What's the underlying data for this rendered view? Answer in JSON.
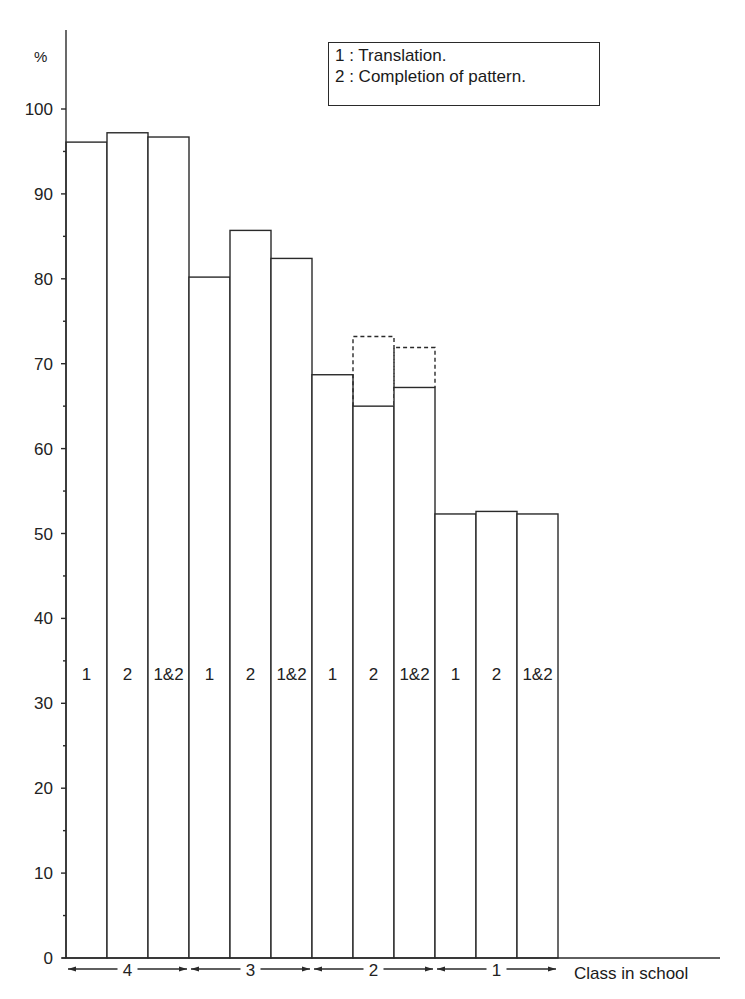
{
  "chart_data": {
    "type": "bar",
    "title": "",
    "xlabel": "Class in school",
    "ylabel": "%",
    "ylim": [
      0,
      100
    ],
    "yticks": [
      0,
      10,
      20,
      30,
      40,
      50,
      60,
      70,
      80,
      90,
      100
    ],
    "grid": false,
    "legend": {
      "position": "top-right",
      "entries": [
        "1 : Translation.",
        "2 : Completion of pattern."
      ]
    },
    "groups": [
      "4",
      "3",
      "2",
      "1"
    ],
    "bar_labels": [
      "1",
      "2",
      "1&2"
    ],
    "series": [
      {
        "name": "1 (Translation)",
        "values": [
          96.1,
          80.2,
          68.7,
          52.3
        ]
      },
      {
        "name": "2 (Completion of pattern)",
        "values": [
          97.2,
          85.7,
          65.0,
          52.6
        ]
      },
      {
        "name": "1&2",
        "values": [
          96.7,
          82.4,
          67.2,
          52.3
        ]
      }
    ],
    "dashed_overlay": {
      "description": "dotted outline above class 2 bars",
      "class": "2",
      "values": {
        "2": 73.2,
        "1&2": 71.9
      }
    }
  },
  "legend": {
    "line1": "1 : Translation.",
    "line2": "2 : Completion of pattern."
  },
  "axis": {
    "ylabel": "%",
    "xlabel": "Class in school",
    "ticks": [
      "0",
      "10",
      "20",
      "30",
      "40",
      "50",
      "60",
      "70",
      "80",
      "90",
      "100"
    ]
  },
  "groups": [
    {
      "label": "4",
      "bars": [
        {
          "label": "1",
          "value": 96.1
        },
        {
          "label": "2",
          "value": 97.2
        },
        {
          "label": "1&2",
          "value": 96.7
        }
      ]
    },
    {
      "label": "3",
      "bars": [
        {
          "label": "1",
          "value": 80.2
        },
        {
          "label": "2",
          "value": 85.7
        },
        {
          "label": "1&2",
          "value": 82.4
        }
      ]
    },
    {
      "label": "2",
      "bars": [
        {
          "label": "1",
          "value": 68.7
        },
        {
          "label": "2",
          "value": 65.0,
          "dashed": 73.2
        },
        {
          "label": "1&2",
          "value": 67.2,
          "dashed": 71.9
        }
      ]
    },
    {
      "label": "1",
      "bars": [
        {
          "label": "1",
          "value": 52.3
        },
        {
          "label": "2",
          "value": 52.6
        },
        {
          "label": "1&2",
          "value": 52.3
        }
      ]
    }
  ]
}
